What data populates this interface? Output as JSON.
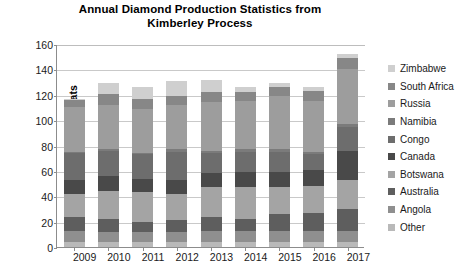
{
  "chart_data": {
    "type": "bar",
    "subtype": "stacked-bar",
    "title": "Annual Diamond Production Statistics from Kimberley  Process",
    "title_line1": "Annual Diamond Production Statistics from",
    "title_line2": "Kimberley  Process",
    "xlabel": "",
    "ylabel": "Millions of Carats",
    "ylim": [
      0,
      160
    ],
    "yticks": [
      0,
      20,
      40,
      60,
      80,
      100,
      120,
      140,
      160
    ],
    "grid": true,
    "legend_position": "right",
    "categories": [
      "2009",
      "2010",
      "2011",
      "2012",
      "2013",
      "2014",
      "2015",
      "2016",
      "2017"
    ],
    "series": [
      {
        "name": "Other",
        "color": "#b9b9b9",
        "values": [
          4,
          4,
          4,
          4,
          4,
          4,
          4,
          4,
          4
        ]
      },
      {
        "name": "Angola",
        "color": "#8f8f8f",
        "values": [
          9,
          8,
          8,
          8,
          9,
          9,
          9,
          9,
          9
        ]
      },
      {
        "name": "Australia",
        "color": "#5e5e5e",
        "values": [
          11,
          10,
          8,
          9,
          11,
          9,
          13,
          14,
          17
        ]
      },
      {
        "name": "Botswana",
        "color": "#a4a4a4",
        "values": [
          18,
          22,
          23,
          21,
          23,
          25,
          21,
          21,
          23
        ]
      },
      {
        "name": "Canada",
        "color": "#494949",
        "values": [
          11,
          12,
          11,
          11,
          11,
          12,
          12,
          13,
          23
        ]
      },
      {
        "name": "Congo",
        "color": "#6d6d6d",
        "values": [
          21,
          20,
          19,
          22,
          16,
          16,
          16,
          12,
          19
        ]
      },
      {
        "name": "Namibia",
        "color": "#7b7b7b",
        "values": [
          1,
          1,
          1,
          2,
          2,
          2,
          2,
          2,
          2
        ]
      },
      {
        "name": "Russia",
        "color": "#9d9d9d",
        "values": [
          35,
          35,
          35,
          35,
          38,
          38,
          42,
          40,
          43
        ]
      },
      {
        "name": "South Africa",
        "color": "#878787",
        "values": [
          6,
          9,
          8,
          7,
          8,
          7,
          7,
          8,
          9
        ]
      },
      {
        "name": "Zimbabwe",
        "color": "#cfcfcf",
        "values": [
          1,
          8,
          9,
          12,
          10,
          4,
          3,
          3,
          3
        ]
      }
    ],
    "totals": [
      117,
      129,
      126,
      131,
      132,
      126,
      129,
      126,
      152
    ],
    "legend_order_top_to_bottom": [
      "Zimbabwe",
      "South Africa",
      "Russia",
      "Namibia",
      "Congo",
      "Canada",
      "Botswana",
      "Australia",
      "Angola",
      "Other"
    ]
  },
  "axis": {
    "y_tick_labels": [
      "160",
      "140",
      "120",
      "100",
      "80",
      "60",
      "40",
      "20",
      "0"
    ],
    "x_tick_labels": [
      "2009",
      "2010",
      "2011",
      "2012",
      "2013",
      "2014",
      "2015",
      "2016",
      "2017"
    ]
  }
}
